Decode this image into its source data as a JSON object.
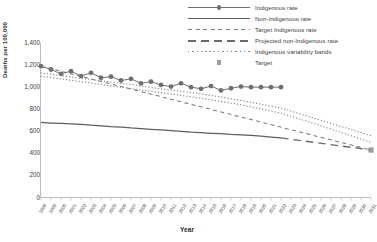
{
  "chart_data": {
    "type": "line",
    "title": "",
    "xlabel": "Year",
    "ylabel": "Deaths per 100,000",
    "ylim": [
      0,
      1400
    ],
    "ytick_labels": [
      "0",
      "200",
      "400",
      "600",
      "800",
      "1,000",
      "1,200",
      "1,400"
    ],
    "ytick_values": [
      0,
      200,
      400,
      600,
      800,
      1000,
      1200,
      1400
    ],
    "grid": false,
    "legend_position": "top-right",
    "x": [
      1998,
      1999,
      2000,
      2001,
      2002,
      2003,
      2004,
      2005,
      2006,
      2007,
      2008,
      2009,
      2010,
      2011,
      2012,
      2013,
      2014,
      2015,
      2016,
      2017,
      2018,
      2019,
      2020,
      2021,
      2022,
      2023,
      2024,
      2025,
      2026,
      2027,
      2028,
      2029,
      2030,
      2031
    ],
    "xtick_labels": [
      "1998",
      "1999",
      "2000",
      "2001",
      "2002",
      "2003",
      "2004",
      "2005",
      "2006",
      "2007",
      "2008",
      "2009",
      "2010",
      "2011",
      "2012",
      "2013",
      "2014",
      "2015",
      "2016",
      "2017",
      "2018",
      "2019",
      "2020",
      "2021",
      "2022",
      "2023",
      "2024",
      "2025",
      "2026",
      "2027",
      "2028",
      "2029",
      "2030",
      "2031"
    ],
    "series": [
      {
        "name": "Indigenous rate",
        "style": "line-marker",
        "color": "#6f6f6f",
        "x": [
          1998,
          1999,
          2000,
          2001,
          2002,
          2003,
          2004,
          2005,
          2006,
          2007,
          2008,
          2009,
          2010,
          2011,
          2012,
          2013,
          2014,
          2015,
          2016,
          2017,
          2018,
          2019,
          2020,
          2021,
          2022
        ],
        "values": [
          1190,
          1160,
          1120,
          1145,
          1100,
          1130,
          1085,
          1095,
          1060,
          1075,
          1035,
          1050,
          1020,
          1005,
          1035,
          1000,
          985,
          1010,
          970,
          990,
          1005,
          1000,
          1000,
          1000,
          1000
        ]
      },
      {
        "name": "Non-Indigenous rate",
        "style": "line",
        "color": "#5e5e5e",
        "x": [
          1998,
          1999,
          2000,
          2001,
          2002,
          2003,
          2004,
          2005,
          2006,
          2007,
          2008,
          2009,
          2010,
          2011,
          2012,
          2013,
          2014,
          2015,
          2016,
          2017,
          2018,
          2019,
          2020,
          2021,
          2022
        ],
        "values": [
          680,
          675,
          672,
          668,
          662,
          655,
          650,
          642,
          638,
          630,
          625,
          618,
          612,
          605,
          600,
          592,
          588,
          582,
          578,
          572,
          568,
          562,
          556,
          548,
          540
        ]
      },
      {
        "name": "Target Indigenous rate",
        "style": "dashed-short",
        "color": "#7a7a7a",
        "x": [
          1998,
          2031
        ],
        "values": [
          1190,
          430
        ]
      },
      {
        "name": "Projected non-Indigenous rate",
        "style": "dashed-long",
        "color": "#6a6a6a",
        "x": [
          2022,
          2031
        ],
        "values": [
          540,
          430
        ]
      },
      {
        "name": "Indigenous variability bands",
        "style": "dotted",
        "color": "#8a8a8a",
        "upper": {
          "x": [
            1998,
            2002,
            2006,
            2010,
            2014,
            2018,
            2022,
            2026,
            2031
          ],
          "values": [
            1130,
            1080,
            1035,
            985,
            940,
            880,
            810,
            700,
            560
          ]
        },
        "lower": {
          "x": [
            1998,
            2002,
            2006,
            2010,
            2014,
            2018,
            2022,
            2026,
            2031
          ],
          "values": [
            1100,
            1050,
            1000,
            950,
            900,
            840,
            765,
            650,
            500
          ]
        }
      },
      {
        "name": "Target",
        "style": "marker-square",
        "color": "#9e9e9e",
        "x": [
          2031
        ],
        "values": [
          430
        ]
      }
    ],
    "legend": [
      {
        "label": "Indigenous rate",
        "key": "line-marker"
      },
      {
        "label": "Non-Indigenous rate",
        "key": "line"
      },
      {
        "label": "Target Indigenous rate",
        "key": "dashed-short"
      },
      {
        "label": "Projected non-Indigenous rate",
        "key": "dashed-long"
      },
      {
        "label": "Indigenous variability bands",
        "key": "dotted"
      },
      {
        "label": "Target",
        "key": "marker-square"
      }
    ]
  }
}
